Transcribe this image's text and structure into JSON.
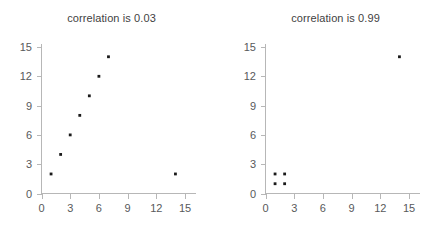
{
  "figure": {
    "background_color": "#ffffff",
    "width": 447,
    "height": 231,
    "panel_count": 2
  },
  "style": {
    "axis_color": "#b7b7b7",
    "tick_label_color": "#58595b",
    "title_color": "#3f3f3f",
    "point_color": "#1a1a1a"
  },
  "panels": {
    "left": {
      "title": "correlation is 0.03"
    },
    "right": {
      "title": "correlation is 0.99"
    }
  },
  "axis": {
    "x_ticks": [
      "0",
      "3",
      "6",
      "9",
      "12",
      "15"
    ],
    "y_ticks": [
      "0",
      "3",
      "6",
      "9",
      "12",
      "15"
    ]
  },
  "chart_data": [
    {
      "type": "scatter",
      "title": "correlation is 0.03",
      "xlabel": "",
      "ylabel": "",
      "xlim": [
        0,
        15
      ],
      "ylim": [
        0,
        15
      ],
      "xticks": [
        0,
        3,
        6,
        9,
        12,
        15
      ],
      "yticks": [
        0,
        3,
        6,
        9,
        12,
        15
      ],
      "grid": false,
      "legend": false,
      "correlation": 0.03,
      "x": [
        1,
        2,
        3,
        4,
        5,
        6,
        7,
        14
      ],
      "y": [
        2,
        4,
        6,
        8,
        10,
        12,
        14,
        2
      ],
      "points": [
        {
          "x": 1,
          "y": 2
        },
        {
          "x": 2,
          "y": 4
        },
        {
          "x": 3,
          "y": 6
        },
        {
          "x": 4,
          "y": 8
        },
        {
          "x": 5,
          "y": 10
        },
        {
          "x": 6,
          "y": 12
        },
        {
          "x": 7,
          "y": 14
        },
        {
          "x": 14,
          "y": 2
        }
      ]
    },
    {
      "type": "scatter",
      "title": "correlation is 0.99",
      "xlabel": "",
      "ylabel": "",
      "xlim": [
        0,
        15
      ],
      "ylim": [
        0,
        15
      ],
      "xticks": [
        0,
        3,
        6,
        9,
        12,
        15
      ],
      "yticks": [
        0,
        3,
        6,
        9,
        12,
        15
      ],
      "grid": false,
      "legend": false,
      "correlation": 0.99,
      "x": [
        1,
        1,
        2,
        2,
        14
      ],
      "y": [
        1,
        2,
        1,
        2,
        14
      ],
      "points": [
        {
          "x": 1,
          "y": 1
        },
        {
          "x": 1,
          "y": 2
        },
        {
          "x": 2,
          "y": 1
        },
        {
          "x": 2,
          "y": 2
        },
        {
          "x": 14,
          "y": 14
        }
      ]
    }
  ]
}
